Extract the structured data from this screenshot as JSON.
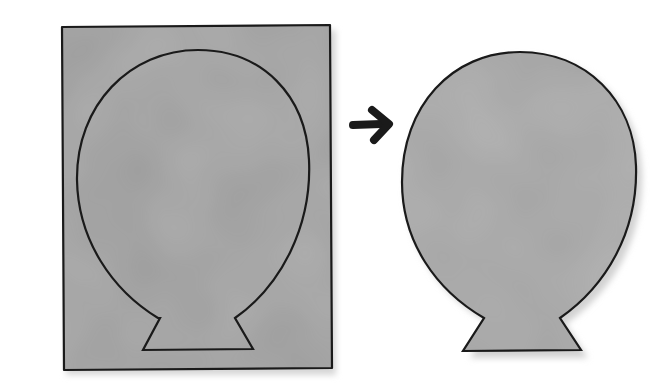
{
  "diagram": {
    "colors": {
      "background": "#ffffff",
      "paper_fill": "#9a9a9a",
      "paper_light": "#b0b0b0",
      "paper_dark": "#8a8a8a",
      "outline": "#1a1a1a",
      "shadow": "#d4d4d4"
    },
    "steps": [
      {
        "label": "sheet-with-traced-balloon",
        "shape": "rectangle-with-balloon-outline"
      },
      {
        "label": "arrow",
        "icon": "arrow-right-icon"
      },
      {
        "label": "cut-out-balloon",
        "shape": "balloon"
      }
    ]
  }
}
